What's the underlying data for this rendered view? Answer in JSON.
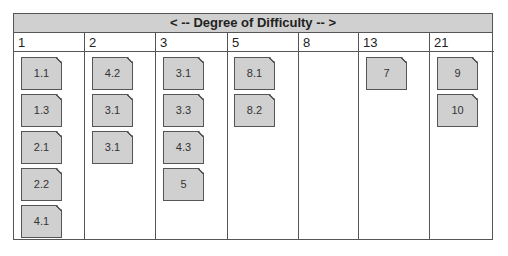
{
  "title": "< -- Degree of Difficulty -- >",
  "columns": [
    {
      "label": "1",
      "cards": [
        "1.1",
        "1.3",
        "2.1",
        "2.2",
        "4.1"
      ]
    },
    {
      "label": "2",
      "cards": [
        "4.2",
        "3.1",
        "3.1"
      ]
    },
    {
      "label": "3",
      "cards": [
        "3.1",
        "3.3",
        "4.3",
        "5"
      ]
    },
    {
      "label": "5",
      "cards": [
        "8.1",
        "8.2"
      ]
    },
    {
      "label": "8",
      "cards": []
    },
    {
      "label": "13",
      "cards": [
        "7"
      ]
    },
    {
      "label": "21",
      "cards": [
        "9",
        "10"
      ]
    }
  ]
}
